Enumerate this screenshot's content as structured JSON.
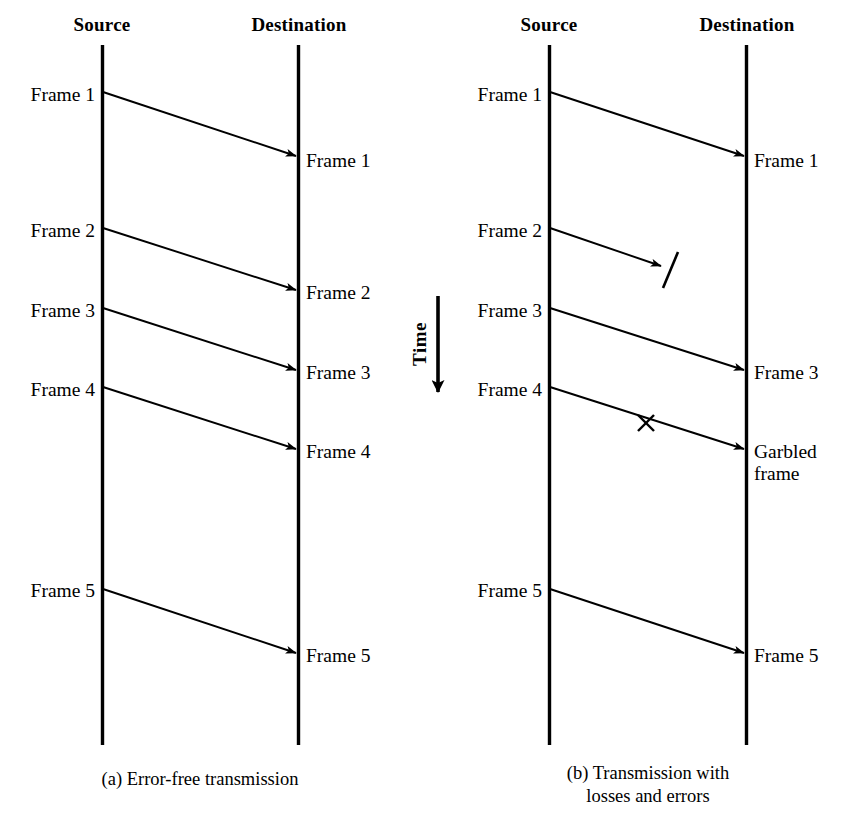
{
  "figure": {
    "time_axis": {
      "label": "Time",
      "direction": "downward"
    },
    "panels": [
      {
        "id": "a",
        "caption": "(a) Error-free transmission",
        "source_header": "Source",
        "destination_header": "Destination",
        "source_x": 102,
        "destination_x": 298,
        "timeline_top": 45,
        "timeline_bottom": 745,
        "caption_x": 200,
        "caption_y": 768,
        "send_labels": [
          {
            "text": "Frame 1",
            "y": 96
          },
          {
            "text": "Frame 2",
            "y": 232
          },
          {
            "text": "Frame 3",
            "y": 312
          },
          {
            "text": "Frame 4",
            "y": 391
          },
          {
            "text": "Frame 5",
            "y": 592
          }
        ],
        "receive_labels": [
          {
            "text": "Frame 1",
            "y": 162
          },
          {
            "text": "Frame 2",
            "y": 294
          },
          {
            "text": "Frame 3",
            "y": 374
          },
          {
            "text": "Frame 4",
            "y": 453
          },
          {
            "text": "Frame 5",
            "y": 657
          }
        ],
        "transmissions": [
          {
            "name": "frame-1",
            "y_start": 92,
            "y_end": 156,
            "status": "delivered",
            "marker": "none"
          },
          {
            "name": "frame-2",
            "y_start": 228,
            "y_end": 290,
            "status": "delivered",
            "marker": "none"
          },
          {
            "name": "frame-3",
            "y_start": 308,
            "y_end": 370,
            "status": "delivered",
            "marker": "none"
          },
          {
            "name": "frame-4",
            "y_start": 387,
            "y_end": 449,
            "status": "delivered",
            "marker": "none"
          },
          {
            "name": "frame-5",
            "y_start": 589,
            "y_end": 653,
            "status": "delivered",
            "marker": "none"
          }
        ]
      },
      {
        "id": "b",
        "caption": "(b) Transmission with\nlosses and errors",
        "source_header": "Source",
        "destination_header": "Destination",
        "source_x": 549,
        "destination_x": 746,
        "timeline_top": 45,
        "timeline_bottom": 745,
        "caption_x": 648,
        "caption_y": 762,
        "send_labels": [
          {
            "text": "Frame 1",
            "y": 96
          },
          {
            "text": "Frame 2",
            "y": 232
          },
          {
            "text": "Frame 3",
            "y": 312
          },
          {
            "text": "Frame 4",
            "y": 391
          },
          {
            "text": "Frame 5",
            "y": 592
          }
        ],
        "receive_labels": [
          {
            "text": "Frame 1",
            "y": 162
          },
          {
            "text": "Frame 3",
            "y": 374
          },
          {
            "text": "Garbled\nframe",
            "y": 453
          },
          {
            "text": "Frame 5",
            "y": 657
          }
        ],
        "transmissions": [
          {
            "name": "frame-1",
            "y_start": 92,
            "y_end": 156,
            "status": "delivered",
            "marker": "none"
          },
          {
            "name": "frame-2",
            "y_start": 228,
            "y_end": 266,
            "status": "lost",
            "marker": "slash"
          },
          {
            "name": "frame-3",
            "y_start": 308,
            "y_end": 370,
            "status": "delivered",
            "marker": "none"
          },
          {
            "name": "frame-4",
            "y_start": 387,
            "y_end": 449,
            "status": "garbled",
            "marker": "cross"
          },
          {
            "name": "frame-5",
            "y_start": 589,
            "y_end": 653,
            "status": "delivered",
            "marker": "none"
          }
        ]
      }
    ]
  },
  "colors": {
    "ink": "#000000",
    "background": "#ffffff"
  }
}
